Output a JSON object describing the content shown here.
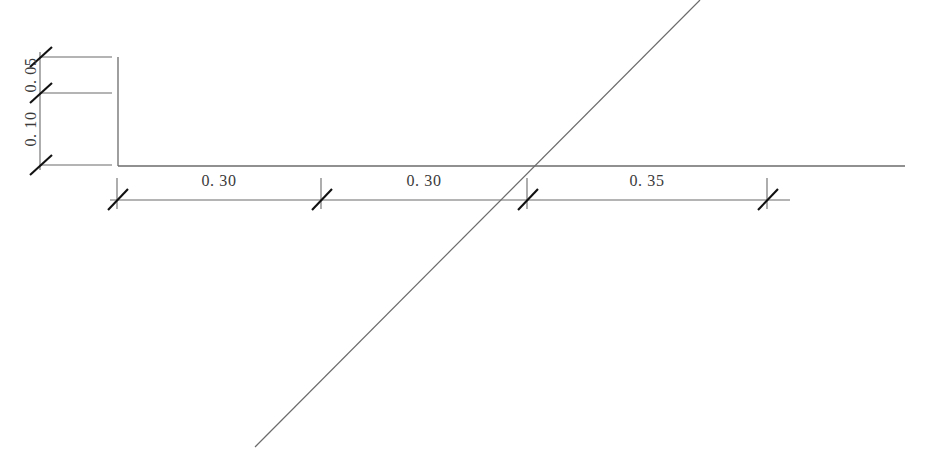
{
  "drawing": {
    "type": "engineering-dimension-drawing",
    "background_color": "#ffffff",
    "line_color": "#555555",
    "tick_color": "#1a1a1a",
    "text_color": "#3a3a3a",
    "canvas": {
      "width": 927,
      "height": 466
    },
    "horizontal_dimensions": [
      {
        "label": "0. 30",
        "value": 0.3,
        "x_start": 117,
        "x_end": 321,
        "text_x": 219,
        "text_y": 186
      },
      {
        "label": "0. 30",
        "value": 0.3,
        "x_start": 321,
        "x_end": 527,
        "text_x": 424,
        "text_y": 186
      },
      {
        "label": "0. 35",
        "value": 0.35,
        "x_start": 527,
        "x_end": 767,
        "text_x": 647,
        "text_y": 186
      }
    ],
    "vertical_dimensions": [
      {
        "label": "0. 05",
        "value": 0.05,
        "y_start": 57,
        "y_end": 93,
        "text_x": 32,
        "text_y": 75
      },
      {
        "label": "0. 10",
        "value": 0.1,
        "y_start": 93,
        "y_end": 165,
        "text_x": 32,
        "text_y": 129
      }
    ],
    "geometry": {
      "baseline": {
        "x1": 118,
        "y1": 166,
        "x2": 905,
        "y2": 166
      },
      "profile_vertical": {
        "x1": 118,
        "y1": 57,
        "x2": 118,
        "y2": 166
      },
      "diagonal": {
        "x1": 255,
        "y1": 447,
        "x2": 700,
        "y2": 0
      },
      "dim_line_horizontal": {
        "x1": 117,
        "y1": 200,
        "x2": 767,
        "y2": 200
      },
      "dim_line_vertical": {
        "x1": 40,
        "y1": 57,
        "x2": 40,
        "y2": 165
      },
      "extension_lines": [
        {
          "x1": 40,
          "y1": 57,
          "x2": 112,
          "y2": 57
        },
        {
          "x1": 40,
          "y1": 93,
          "x2": 112,
          "y2": 93
        },
        {
          "x1": 40,
          "y1": 165,
          "x2": 112,
          "y2": 165
        },
        {
          "x1": 117,
          "y1": 178,
          "x2": 117,
          "y2": 207
        },
        {
          "x1": 321,
          "y1": 178,
          "x2": 321,
          "y2": 207
        },
        {
          "x1": 527,
          "y1": 178,
          "x2": 527,
          "y2": 207
        },
        {
          "x1": 767,
          "y1": 178,
          "x2": 767,
          "y2": 207
        }
      ],
      "tick_marks_horizontal": [
        117,
        321,
        527,
        767
      ],
      "tick_marks_vertical": [
        57,
        93,
        165
      ]
    }
  }
}
